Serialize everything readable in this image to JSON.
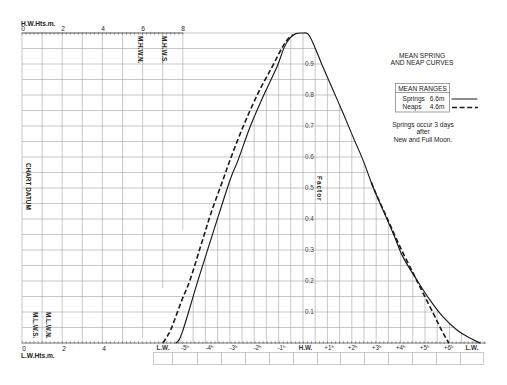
{
  "diagram": {
    "title_lines": [
      "MEAN SPRING",
      "AND NEAP CURVES"
    ],
    "legend": {
      "header": "MEAN RANGES",
      "rows": [
        {
          "label": "Springs",
          "value": "6.6m",
          "line_style": "solid"
        },
        {
          "label": "Neaps",
          "value": "4.6m",
          "line_style": "dashed"
        }
      ]
    },
    "note_lines": [
      "Springs occur 3 days",
      "after",
      "New and Full Moon."
    ],
    "hw_height_axis": {
      "title": "H.W.Hts.m.",
      "ticks": [
        "0",
        "2",
        "4",
        "6",
        "8"
      ]
    },
    "lw_height_axis": {
      "title": "L.W.Hts.m.",
      "ticks": [
        "0",
        "2",
        "4"
      ]
    },
    "vertical_labels": {
      "mhwn": "M.H.W.N.",
      "mhws": "M.H.W.S.",
      "chart_datum": "CHART DATUM",
      "mlws": "M.L.W.S.",
      "mlwn": "M.L.W.N.",
      "factor": "Factor"
    },
    "factor_ticks": [
      "0.1",
      "0.2",
      "0.3",
      "0.4",
      "0.5",
      "0.6",
      "0.7",
      "0.8",
      "0.9"
    ],
    "time_axis": {
      "labels": [
        "L.W.",
        "-5ʰ",
        "-4ʰ",
        "-3ʰ",
        "-2ʰ",
        "-1ʰ",
        "H.W.",
        "+1ʰ",
        "+2ʰ",
        "+3ʰ",
        "+4ʰ",
        "+5ʰ",
        "+6ʰ",
        "L.W."
      ],
      "bold": [
        true,
        false,
        false,
        false,
        false,
        false,
        true,
        false,
        false,
        false,
        false,
        false,
        false,
        true
      ]
    },
    "colors": {
      "grid": "#a3a3a3",
      "curve": "#1a1a1a",
      "text": "#222222",
      "background": "#ffffff"
    }
  },
  "chart_data": {
    "type": "line",
    "title": "MEAN SPRING AND NEAP CURVES",
    "xlabel": "",
    "ylabel": "Factor",
    "x_tick_labels": [
      "L.W.",
      "-5ʰ",
      "-4ʰ",
      "-3ʰ",
      "-2ʰ",
      "-1ʰ",
      "H.W.",
      "+1ʰ",
      "+2ʰ",
      "+3ʰ",
      "+4ʰ",
      "+5ʰ",
      "+6ʰ",
      "L.W."
    ],
    "y_tick_values": [
      0.1,
      0.2,
      0.3,
      0.4,
      0.5,
      0.6,
      0.7,
      0.8,
      0.9
    ],
    "xlim": [
      -6.15,
      7.4
    ],
    "ylim": [
      0,
      1
    ],
    "grid": true,
    "legend_position": "right",
    "height_axes": {
      "hw": {
        "label": "H.W.Hts.m.",
        "range_m": [
          0,
          8
        ]
      },
      "lw": {
        "label": "L.W.Hts.m.",
        "range_m": [
          0,
          8
        ]
      }
    },
    "series": [
      {
        "name": "Springs",
        "mean_range": "6.6m",
        "style": "solid",
        "points": [
          [
            -5.2,
            0
          ],
          [
            -5.08,
            0.01
          ],
          [
            -4.96,
            0.032
          ],
          [
            -4.75,
            0.084
          ],
          [
            -4.51,
            0.148
          ],
          [
            -4.3,
            0.203
          ],
          [
            -3.65,
            0.365
          ],
          [
            -2.99,
            0.526
          ],
          [
            -2.66,
            0.59
          ],
          [
            -2.17,
            0.697
          ],
          [
            -1.64,
            0.794
          ],
          [
            -1.07,
            0.89
          ],
          [
            -0.78,
            0.952
          ],
          [
            -0.53,
            0.984
          ],
          [
            -0.29,
            0.998
          ],
          [
            0,
            1
          ],
          [
            0.2,
            0.997
          ],
          [
            0.41,
            0.968
          ],
          [
            0.82,
            0.89
          ],
          [
            1.23,
            0.816
          ],
          [
            1.64,
            0.742
          ],
          [
            2.05,
            0.665
          ],
          [
            2.46,
            0.59
          ],
          [
            2.87,
            0.503
          ],
          [
            3.28,
            0.429
          ],
          [
            3.69,
            0.355
          ],
          [
            4.1,
            0.277
          ],
          [
            4.67,
            0.203
          ],
          [
            5.2,
            0.139
          ],
          [
            5.74,
            0.084
          ],
          [
            6.31,
            0.042
          ],
          [
            6.84,
            0.016
          ],
          [
            7.25,
            0
          ]
        ]
      },
      {
        "name": "Neaps",
        "mean_range": "4.6m",
        "style": "dashed",
        "segments": [
          [
            [
              -5.74,
              0
            ],
            [
              -5.53,
              0.026
            ],
            [
              -5.37,
              0.052
            ],
            [
              -4.96,
              0.139
            ],
            [
              -4.63,
              0.203
            ],
            [
              -4.18,
              0.316
            ],
            [
              -3.77,
              0.419
            ],
            [
              -3.28,
              0.526
            ],
            [
              -2.99,
              0.59
            ],
            [
              -2.46,
              0.697
            ],
            [
              -1.84,
              0.806
            ],
            [
              -1.27,
              0.89
            ],
            [
              -0.86,
              0.952
            ],
            [
              -0.61,
              0.981
            ],
            [
              -0.41,
              0.994
            ]
          ],
          [
            [
              2.8,
              0.518
            ],
            [
              3.0,
              0.48
            ],
            [
              3.48,
              0.397
            ],
            [
              3.98,
              0.31
            ],
            [
              4.51,
              0.226
            ],
            [
              4.92,
              0.161
            ],
            [
              5.33,
              0.097
            ],
            [
              5.61,
              0.052
            ],
            [
              5.9,
              0.01
            ],
            [
              5.98,
              0
            ]
          ]
        ]
      }
    ]
  }
}
